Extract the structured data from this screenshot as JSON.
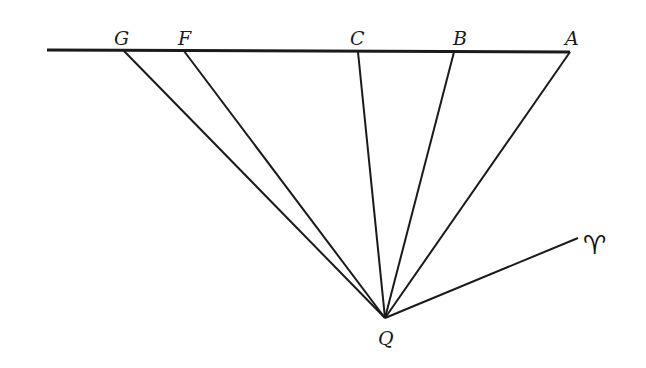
{
  "diagram": {
    "type": "geometric-figure",
    "colors": {
      "ink": "#1a1a1a",
      "background": "#ffffff"
    },
    "baseline": {
      "from": [
        47,
        50
      ],
      "to": [
        570,
        52
      ]
    },
    "points": [
      {
        "label": "G",
        "x": 124,
        "y": 51,
        "label_x": 114,
        "label_y": 45
      },
      {
        "label": "F",
        "x": 184,
        "y": 51,
        "label_x": 178,
        "label_y": 45
      },
      {
        "label": "C",
        "x": 358,
        "y": 52,
        "label_x": 350,
        "label_y": 45
      },
      {
        "label": "B",
        "x": 454,
        "y": 52,
        "label_x": 453,
        "label_y": 45
      },
      {
        "label": "A",
        "x": 570,
        "y": 52,
        "label_x": 565,
        "label_y": 45
      }
    ],
    "apex": {
      "label": "Q",
      "x": 385,
      "y": 318,
      "label_x": 378,
      "label_y": 345
    },
    "aries_ray": {
      "to": [
        578,
        238
      ],
      "symbol": "♈",
      "symbol_x": 583,
      "symbol_y": 254
    }
  }
}
